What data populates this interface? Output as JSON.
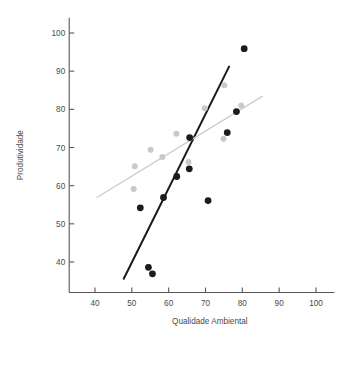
{
  "chart_data": {
    "type": "scatter",
    "title": "",
    "xlabel": "Qualidade Ambiental",
    "ylabel": "Produtividade",
    "xlim": [
      33,
      105
    ],
    "ylim": [
      32,
      104
    ],
    "xticks": [
      40,
      50,
      60,
      70,
      80,
      90,
      100
    ],
    "yticks": [
      40,
      50,
      60,
      70,
      80,
      90,
      100
    ],
    "xtick_labels": [
      "40",
      "50",
      "60",
      "70",
      "80",
      "90",
      "100"
    ],
    "ytick_labels": [
      "40",
      "50",
      "60",
      "70",
      "80",
      "90",
      "100"
    ],
    "grid": false,
    "legend": "none",
    "series": [
      {
        "name": "dark-group",
        "color": "#1c1c1e",
        "marker": "circle",
        "points": [
          {
            "x": 52.3,
            "y": 54.2
          },
          {
            "x": 54.5,
            "y": 38.6
          },
          {
            "x": 58.6,
            "y": 56.9
          },
          {
            "x": 62.2,
            "y": 62.4
          },
          {
            "x": 65.6,
            "y": 64.4
          },
          {
            "x": 65.7,
            "y": 72.6
          },
          {
            "x": 70.7,
            "y": 56.1
          },
          {
            "x": 55.6,
            "y": 36.9
          },
          {
            "x": 75.9,
            "y": 73.9
          },
          {
            "x": 78.4,
            "y": 79.4
          },
          {
            "x": 80.5,
            "y": 95.9
          }
        ]
      },
      {
        "name": "light-group",
        "color": "#c9c9cb",
        "marker": "circle",
        "points": [
          {
            "x": 50.5,
            "y": 59.1
          },
          {
            "x": 50.8,
            "y": 65.1
          },
          {
            "x": 55.1,
            "y": 69.4
          },
          {
            "x": 58.3,
            "y": 67.5
          },
          {
            "x": 62.1,
            "y": 73.6
          },
          {
            "x": 65.4,
            "y": 66.2
          },
          {
            "x": 69.8,
            "y": 80.3
          },
          {
            "x": 74.9,
            "y": 72.3
          },
          {
            "x": 75.1,
            "y": 86.3
          },
          {
            "x": 79.7,
            "y": 81.0
          }
        ]
      }
    ],
    "fit_lines": [
      {
        "name": "dark-fit",
        "color": "#1a1a1c",
        "x_start": 47.8,
        "y_start": 35.6,
        "x_end": 76.4,
        "y_end": 91.2
      },
      {
        "name": "light-fit",
        "color": "#cccccd",
        "x_start": 40.5,
        "y_start": 56.9,
        "x_end": 85.4,
        "y_end": 83.4
      }
    ]
  }
}
